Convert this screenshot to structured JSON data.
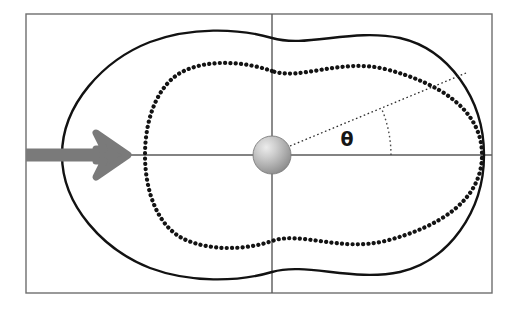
{
  "figure": {
    "background_color": "#ffffff",
    "width": 516,
    "height": 311
  },
  "frame": {
    "name": "plot-frame",
    "x": 26,
    "y": 14,
    "width": 466,
    "height": 279,
    "stroke_color": "#6e6e6e",
    "stroke_width": 1.4,
    "fill": "none"
  },
  "axes": {
    "horizontal": {
      "label": "horizontal-axis",
      "x1": 26,
      "y1": 155,
      "x2": 492,
      "y2": 155,
      "color": "#5a5a5a",
      "width": 1.4
    },
    "vertical": {
      "label": "vertical-axis",
      "x1": 272,
      "y1": 14,
      "x2": 272,
      "y2": 293,
      "color": "#5a5a5a",
      "width": 1.4
    }
  },
  "scatterer": {
    "name": "scattering-center-sphere",
    "cx": 272,
    "cy": 155,
    "r": 19,
    "fill_light": "#e2e2e2",
    "fill_mid": "#b5b5b5",
    "fill_dark": "#8d8d8d",
    "edge_color": "#7c7c7c"
  },
  "incident_beam": {
    "name": "incident-beam-arrow",
    "color": "#7a7a7a",
    "shaft_start_x": 26,
    "shaft_end_x": 128,
    "shaft_y": 155,
    "shaft_thickness": 13,
    "head_length": 36,
    "head_half_height": 30,
    "direction": "right"
  },
  "curves": {
    "outer": {
      "name": "outer-solid-contour",
      "style": "solid",
      "color": "#121212",
      "width": 2.4,
      "description": "Peanut-shaped closed contour, wider lobe on the right",
      "extents": {
        "left_x": 62,
        "right_x": 484,
        "top_y": 28,
        "bottom_y": 282,
        "waist_top_y": 38,
        "waist_bottom_y": 272,
        "waist_x": 272
      }
    },
    "inner": {
      "name": "inner-dotted-contour",
      "style": "dotted",
      "color": "#131313",
      "width": 4.2,
      "dash_gap": 5.2,
      "description": "Dotted closed contour nested inside, touching outer contour at far right",
      "extents": {
        "left_x": 145,
        "right_x": 482,
        "top_y": 56,
        "bottom_y": 255,
        "waist_top_y": 71,
        "waist_bottom_y": 241,
        "waist_x": 272
      }
    }
  },
  "angle_marker": {
    "name": "scattering-angle-theta",
    "symbol": "θ",
    "label_x": 347,
    "label_y": 146,
    "ray": {
      "name": "theta-ray",
      "from_x": 290,
      "from_y": 146,
      "to_x": 466,
      "to_y": 73,
      "style": "dotted",
      "color": "#2a2a2a",
      "width": 1.3,
      "dash": "1.6 2.6"
    },
    "arc": {
      "name": "theta-arc",
      "center_x": 272,
      "center_y": 155,
      "radius": 119,
      "start_angle_deg": 0,
      "end_angle_deg": 23,
      "style": "dotted",
      "color": "#4a4a4a",
      "width": 1.4,
      "dash": "1.6 2.8"
    },
    "approx_angle_degrees": 23
  }
}
